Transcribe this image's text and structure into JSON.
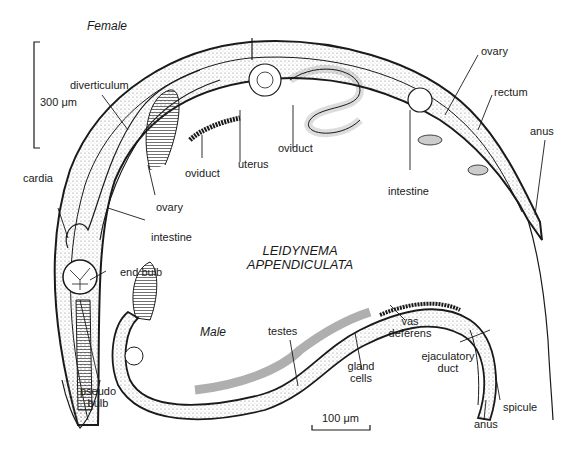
{
  "figure": {
    "species_line1": "LEIDYNEMA",
    "species_line2": "APPENDICULATA",
    "female_label": "Female",
    "male_label": "Male",
    "scale_female": "300 μm",
    "scale_male": "100 μm"
  },
  "female_labels": {
    "diverticulum": "diverticulum",
    "cardia": "cardia",
    "oviduct_left": "oviduct",
    "ovary_left": "ovary",
    "intestine_left": "intestine",
    "end_bulb": "end bulb",
    "pseudo_bulb_1": "pseudo",
    "pseudo_bulb_2": "bulb",
    "uterus": "uterus",
    "oviduct_mid": "oviduct",
    "intestine_right": "intestine",
    "ovary_right": "ovary",
    "rectum": "rectum",
    "anus": "anus"
  },
  "male_labels": {
    "testes": "testes",
    "gland_cells_1": "gland",
    "gland_cells_2": "cells",
    "vas_deferens_1": "vas",
    "vas_deferens_2": "deferens",
    "ejaculatory_duct_1": "ejaculatory",
    "ejaculatory_duct_2": "duct",
    "spicule": "spicule",
    "anus": "anus"
  },
  "colors": {
    "ink": "#1a1a1a",
    "stipple": "#9a9a9a",
    "background": "#ffffff"
  }
}
